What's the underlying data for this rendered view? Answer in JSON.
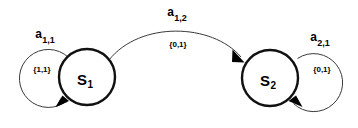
{
  "diagram": {
    "type": "finite-state-machine",
    "title": "",
    "background_color": "#ffffff",
    "stroke_color": "#111111",
    "states": [
      {
        "id": "S1",
        "base": "S",
        "subscript": "1",
        "cx": 87,
        "cy": 77,
        "r": 28
      },
      {
        "id": "S2",
        "base": "S",
        "subscript": "2",
        "cx": 270,
        "cy": 78,
        "r": 28
      }
    ],
    "transitions": [
      {
        "id": "a-1-1",
        "from": "S1",
        "to": "S1",
        "kind": "self-loop",
        "label_base": "a",
        "label_subscript": "1,1",
        "set_label": "{1,1}",
        "label_x": 45,
        "label_y": 38,
        "set_x": 42,
        "set_y": 72,
        "loop_cx": 44,
        "loop_cy": 81,
        "loop_r": 29
      },
      {
        "id": "a-1-2",
        "from": "S1",
        "to": "S2",
        "kind": "arc",
        "label_base": "a",
        "label_subscript": "1,2",
        "set_label": "{0,1}",
        "label_x": 177,
        "label_y": 16,
        "set_x": 178,
        "set_y": 47
      },
      {
        "id": "a-2-1",
        "from": "S2",
        "to": "S2",
        "kind": "self-loop",
        "label_base": "a",
        "label_subscript": "2,1",
        "set_label": "{0,1}",
        "label_x": 320,
        "label_y": 41,
        "set_x": 322,
        "set_y": 72,
        "loop_cx": 322,
        "loop_cy": 82,
        "loop_r": 29
      }
    ]
  }
}
